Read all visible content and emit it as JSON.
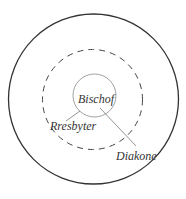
{
  "diagram": {
    "title": "",
    "colors": {
      "background": "#ffffff",
      "outer_circle": "#333333",
      "dashed_circle": "#444444",
      "inner_circle": "#888888",
      "leader_lines": "#777777",
      "text": "#333333"
    },
    "circles": [
      {
        "id": "outer",
        "cx": 93.5,
        "cy": 99,
        "r": 85,
        "style": "solid"
      },
      {
        "id": "middle",
        "cx": 92.5,
        "cy": 99.5,
        "r": 50,
        "style": "dashed"
      },
      {
        "id": "inner",
        "cx": 94.5,
        "cy": 95.5,
        "r": 21.5,
        "style": "solid-thin"
      }
    ],
    "labels": {
      "center": "Bischof",
      "middle": "Rresbyter",
      "outer": "Diakone"
    },
    "leader_lines": [
      {
        "target": "middle",
        "x1": 66,
        "y1": 121,
        "x2": 80,
        "y2": 111
      },
      {
        "target": "outer",
        "x1": 100,
        "y1": 108,
        "x2": 136,
        "y2": 146
      }
    ]
  }
}
